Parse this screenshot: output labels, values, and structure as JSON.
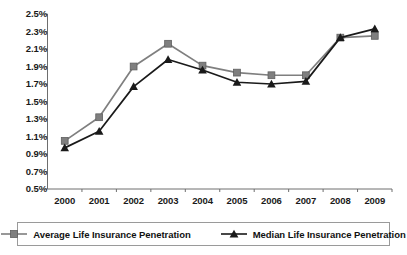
{
  "chart_data": {
    "type": "line",
    "title": "",
    "xlabel": "",
    "ylabel": "",
    "categories": [
      "2000",
      "2001",
      "2002",
      "2003",
      "2004",
      "2005",
      "2006",
      "2007",
      "2008",
      "2009"
    ],
    "x": [
      2000,
      2001,
      2002,
      2003,
      2004,
      2005,
      2006,
      2007,
      2008,
      2009
    ],
    "ylim": [
      0.5,
      2.5
    ],
    "ytick_values": [
      0.5,
      0.7,
      0.9,
      1.1,
      1.3,
      1.5,
      1.7,
      1.9,
      2.1,
      2.3,
      2.5
    ],
    "ytick_labels": [
      "0.5%",
      "0.7%",
      "0.9%",
      "1.1%",
      "1.3%",
      "1.5%",
      "1.7%",
      "1.9%",
      "2.1%",
      "2.3%",
      "2.5%"
    ],
    "grid": false,
    "legend_position": "bottom",
    "series": [
      {
        "name": "Average Life Insurance Penetration",
        "marker": "square",
        "color": "#7f7f7f",
        "values": [
          1.05,
          1.32,
          1.9,
          2.16,
          1.91,
          1.83,
          1.8,
          1.8,
          2.23,
          2.25
        ]
      },
      {
        "name": "Median Life Insurance Penetration",
        "marker": "triangle",
        "color": "#1a1a1a",
        "values": [
          0.97,
          1.16,
          1.67,
          1.98,
          1.86,
          1.72,
          1.7,
          1.73,
          2.23,
          2.33
        ]
      }
    ]
  },
  "legend": {
    "entries": [
      {
        "label": "Average Life Insurance Penetration"
      },
      {
        "label": "Median Life Insurance Penetration"
      }
    ]
  },
  "colors": {
    "average_series": "#7f7f7f",
    "median_series": "#1a1a1a",
    "axis": "#6e6e6e",
    "legend_border": "#9a9a9a",
    "text": "#1a1a1a"
  }
}
